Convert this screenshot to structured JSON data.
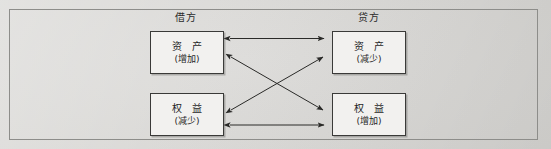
{
  "diagram": {
    "background_color": "#d9d9d7",
    "frame_border_color": "#8d8d8a",
    "box_border_color": "#3a3a38",
    "box_fill_color": "#f2f1ef",
    "arrow_color": "#2a2a28",
    "headers": {
      "debit": "借方",
      "credit": "贷方"
    },
    "boxes": [
      {
        "id": "asset-debit",
        "title": "资  产",
        "subtitle": "(增加)",
        "column": "借方",
        "row": "top"
      },
      {
        "id": "asset-credit",
        "title": "资  产",
        "subtitle": "(减少)",
        "column": "贷方",
        "row": "top"
      },
      {
        "id": "equity-debit",
        "title": "权  益",
        "subtitle": "(减少)",
        "column": "借方",
        "row": "bottom"
      },
      {
        "id": "equity-credit",
        "title": "权  益",
        "subtitle": "(增加)",
        "column": "贷方",
        "row": "bottom"
      }
    ],
    "connectors": [
      {
        "id": "top-horizontal",
        "from": "asset-debit",
        "to": "asset-credit",
        "style": "double-arrow"
      },
      {
        "id": "bottom-horizontal",
        "from": "equity-debit",
        "to": "equity-credit",
        "style": "double-arrow"
      },
      {
        "id": "diagonal-down",
        "from": "asset-debit",
        "to": "equity-credit",
        "style": "double-arrow"
      },
      {
        "id": "diagonal-up",
        "from": "equity-debit",
        "to": "asset-credit",
        "style": "double-arrow"
      }
    ]
  }
}
